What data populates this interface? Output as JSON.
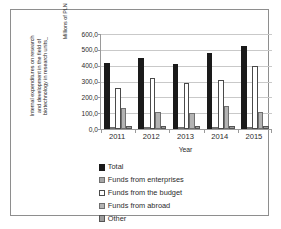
{
  "chart_data": {
    "type": "bar",
    "title": "",
    "xlabel": "Year",
    "ylabel": "Internal expenditures on research and development in the field of biotechnology in research units_ Millions of PLN",
    "ylabel_lines": [
      "Internal expenditures on research",
      "and development in the field of",
      "biotechnology in research units_"
    ],
    "ylabel_unit": "Millions of PLN",
    "categories": [
      "2011",
      "2012",
      "2013",
      "2014",
      "2015"
    ],
    "ylim": [
      0,
      600
    ],
    "ytick_labels": [
      "600,0",
      "500,0",
      "400,0",
      "300,0",
      "200,0",
      "100,0",
      "0,0"
    ],
    "ytick_values": [
      600,
      500,
      400,
      300,
      200,
      100,
      0
    ],
    "grid": true,
    "legend_position": "bottom-left",
    "series": [
      {
        "name": "Total",
        "color": "#1a1a1a",
        "values": [
          417,
          448,
          413,
          480,
          525
        ]
      },
      {
        "name": "Funds from enterprises",
        "color": "#a6a6a6",
        "values": [
          9,
          10,
          9,
          11,
          12
        ]
      },
      {
        "name": "Funds from the budget",
        "color": "#ffffff",
        "values": [
          259,
          320,
          293,
          312,
          396
        ]
      },
      {
        "name": "Funds from abroad",
        "color": "#b3b3b3",
        "values": [
          130,
          108,
          100,
          148,
          105
        ]
      },
      {
        "name": "Other",
        "color": "#9d9d9d",
        "values": [
          19,
          18,
          20,
          22,
          18
        ]
      }
    ]
  },
  "legend": {
    "items": [
      {
        "label": "Total",
        "swatch": "legend-swatch-total"
      },
      {
        "label": "Funds from enterprises",
        "swatch": "legend-swatch-enterprises"
      },
      {
        "label": "Funds from the budget",
        "swatch": "legend-swatch-budget"
      },
      {
        "label": "Funds from abroad",
        "swatch": "legend-swatch-abroad"
      },
      {
        "label": "Other",
        "swatch": "legend-swatch-other"
      }
    ]
  }
}
